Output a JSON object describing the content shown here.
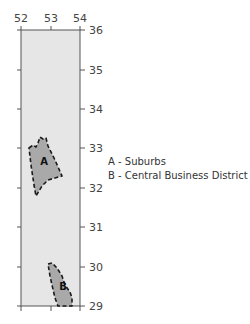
{
  "map": {
    "frame": {
      "x": 21,
      "y": 30,
      "width": 59,
      "height": 276
    },
    "colors": {
      "background": "#e6e6e6",
      "region_fill": "#a9a9a9",
      "frame_stroke": "#555555",
      "region_stroke": "#1a1a1a"
    },
    "x_axis": {
      "position": "top",
      "ticks": [
        {
          "label": "52",
          "x": 21
        },
        {
          "label": "53",
          "x": 51
        },
        {
          "label": "54",
          "x": 80
        }
      ]
    },
    "y_axis": {
      "position": "right",
      "ticks": [
        {
          "label": "36",
          "y": 30
        },
        {
          "label": "35",
          "y": 70
        },
        {
          "label": "34",
          "y": 109
        },
        {
          "label": "33",
          "y": 148
        },
        {
          "label": "32",
          "y": 188
        },
        {
          "label": "31",
          "y": 227
        },
        {
          "label": "30",
          "y": 267
        },
        {
          "label": "29",
          "y": 306
        }
      ]
    },
    "regions": [
      {
        "id": "A",
        "label": "A",
        "points": "29,148 33,145 36,147 38,143 40,137 43,139 46,138 48,146 55,160 62,176 55,178 48,180 42,186 36,196 34,185 31,165",
        "label_pos": {
          "x": 44,
          "y": 165
        }
      },
      {
        "id": "B",
        "label": "B",
        "points": "48,264 52,263 57,268 62,276 65,285 70,292 72,298 72,306 58,306 55,298 52,285 50,276",
        "label_pos": {
          "x": 63,
          "y": 290
        }
      }
    ]
  },
  "legend": {
    "items": [
      {
        "key": "A",
        "text": "A - Suburbs"
      },
      {
        "key": "B",
        "text": "B - Central Business District"
      }
    ]
  }
}
